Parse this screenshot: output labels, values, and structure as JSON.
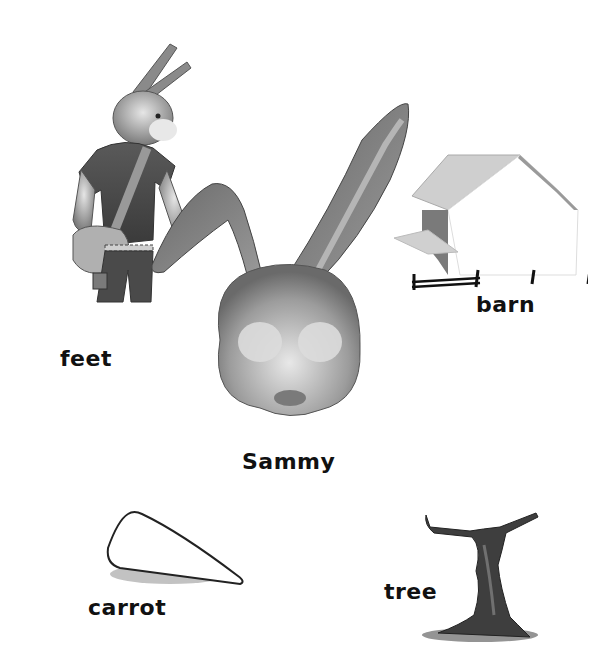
{
  "labels": {
    "feet": "feet",
    "sammy": "Sammy",
    "barn": "barn",
    "carrot": "carrot",
    "tree": "tree"
  },
  "illustrations": [
    {
      "name": "rabbit-standing",
      "caption": "feet"
    },
    {
      "name": "rabbit-head",
      "caption": "Sammy"
    },
    {
      "name": "barn",
      "caption": "barn"
    },
    {
      "name": "carrot",
      "caption": "carrot"
    },
    {
      "name": "tree",
      "caption": "tree"
    }
  ],
  "colors": {
    "background": "#ffffff",
    "text": "#111111",
    "illustration_dark": "#444444",
    "illustration_mid": "#888888",
    "illustration_light": "#d8d8d8"
  }
}
